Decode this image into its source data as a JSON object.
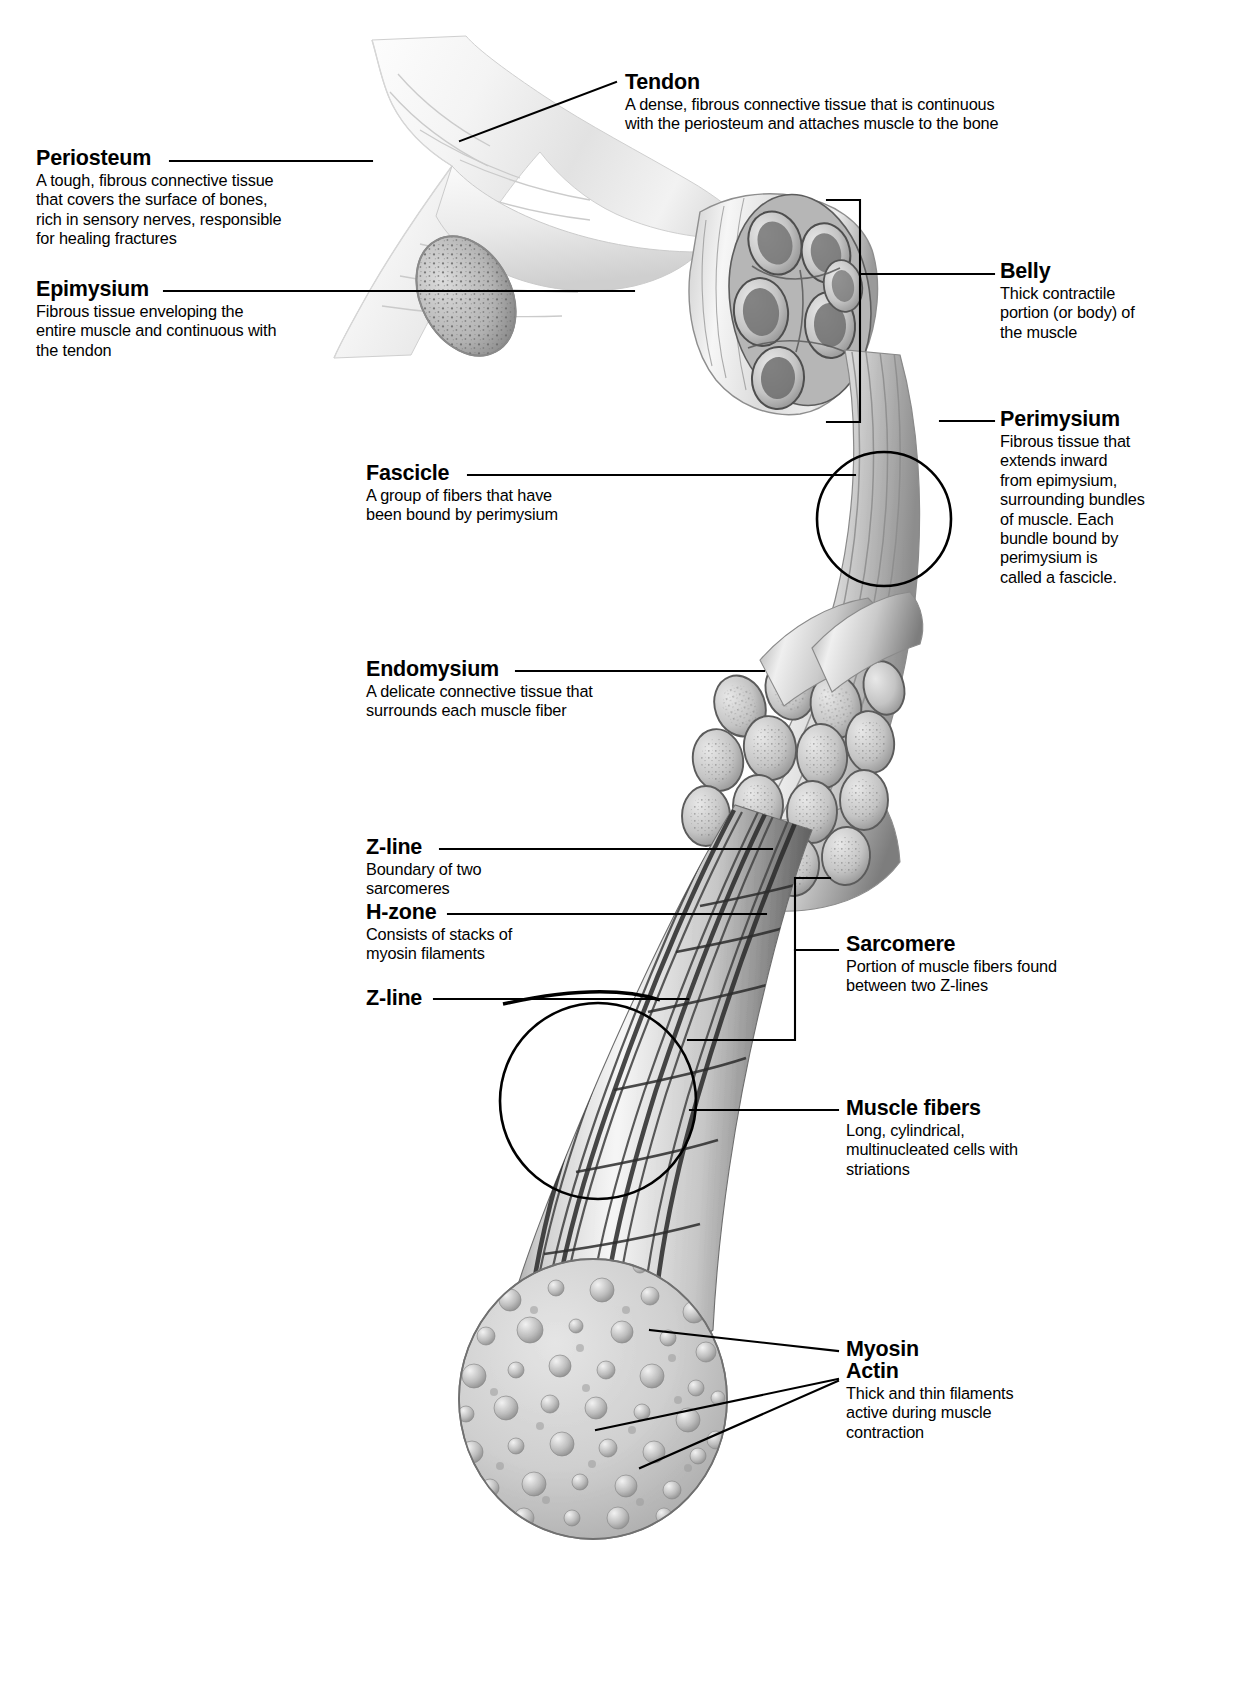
{
  "figure": {
    "ink_color": "#000000",
    "background_color": "#ffffff"
  },
  "callouts": [
    {
      "id": "tendon",
      "term": "Tendon",
      "desc": [
        "A dense, fibrous connective tissue that is continuous",
        "with the periosteum and attaches muscle to the bone"
      ]
    },
    {
      "id": "periosteum",
      "term": "Periosteum",
      "desc": [
        "A tough, fibrous connective tissue",
        "that covers the surface of bones,",
        "rich in sensory nerves, responsible",
        "for healing fractures"
      ]
    },
    {
      "id": "epimysium",
      "term": "Epimysium",
      "desc": [
        "Fibrous tissue enveloping the",
        "entire muscle and continuous with",
        "the tendon"
      ]
    },
    {
      "id": "belly",
      "term": "Belly",
      "desc": [
        "Thick contractile",
        "portion (or body) of",
        "the muscle"
      ]
    },
    {
      "id": "perimysium",
      "term": "Perimysium",
      "desc": [
        "Fibrous tissue that",
        "extends inward",
        "from epimysium,",
        "surrounding bundles",
        "of muscle. Each",
        "bundle bound by",
        "perimysium is",
        "called a fascicle."
      ]
    },
    {
      "id": "fascicle",
      "term": "Fascicle",
      "desc": [
        "A group of fibers that have",
        "been bound by perimysium"
      ]
    },
    {
      "id": "endomysium",
      "term": "Endomysium",
      "desc": [
        "A delicate connective tissue that",
        "surrounds each muscle fiber"
      ]
    },
    {
      "id": "z-line-upper",
      "term": "Z-line",
      "desc": [
        "Boundary of two",
        "sarcomeres"
      ]
    },
    {
      "id": "h-zone",
      "term": "H-zone",
      "desc": [
        "Consists of stacks of",
        "myosin filaments"
      ]
    },
    {
      "id": "z-line-lower",
      "term": "Z-line",
      "desc": []
    },
    {
      "id": "sarcomere",
      "term": "Sarcomere",
      "desc": [
        "Portion of muscle fibers found",
        "between two Z-lines"
      ]
    },
    {
      "id": "muscle-fibers",
      "term": "Muscle fibers",
      "desc": [
        "Long, cylindrical,",
        "multinucleated cells with",
        "striations"
      ]
    },
    {
      "id": "myosin",
      "term": "Myosin",
      "desc": []
    },
    {
      "id": "actin",
      "term": "Actin",
      "desc": [
        "Thick and thin filaments",
        "active during muscle",
        "contraction"
      ]
    }
  ]
}
